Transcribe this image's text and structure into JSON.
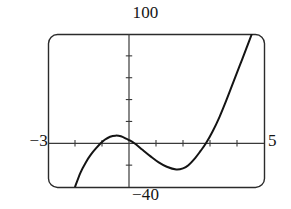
{
  "figure": {
    "kind": "graphing-calculator-viewport",
    "title": "",
    "frame": {
      "stroke_color": "#2b2b2b",
      "fill_color": "#ffffff",
      "corner_radius_px": 9,
      "left_px": 48,
      "top_px": 34,
      "right_px": 264,
      "bottom_px": 187
    },
    "labels": {
      "y_max": "100",
      "y_min": "−40",
      "x_min": "−3",
      "x_max": "5"
    }
  },
  "chart_data": {
    "type": "line",
    "title": "",
    "xlabel": "",
    "ylabel": "",
    "xlim": [
      -3,
      5
    ],
    "ylim": [
      -40,
      100
    ],
    "grid": false,
    "legend": null,
    "axis_style": "calculator-window-with-tick-marks",
    "x_ticks": [
      -3,
      -2,
      -1,
      0,
      1,
      2,
      3,
      4,
      5
    ],
    "y_ticks": [
      -40,
      -20,
      0,
      20,
      40,
      60,
      80,
      100
    ],
    "x_tick_interval": 1,
    "y_tick_interval": 20,
    "tick_labels_shown": false,
    "window_corner_labels": {
      "top": "100",
      "bottom": "−40",
      "left": "−3",
      "right": "5"
    },
    "curve": {
      "name": "cubic polynomial",
      "color": "#141414",
      "line_width_px": 2,
      "shape_description": "rises from below lower-left, crosses x-axis near x=-1.05, local maximum near x=-0.5 (y≈7), decreases through origin region, local minimum near x=1.75 (y≈-24), then rises steeply crossing x-axis near x=2.85 and exiting the top of the window near x=4.55",
      "x_intercepts": [
        -1.05,
        2.85
      ],
      "local_maximum": {
        "x": -0.5,
        "y": 7
      },
      "local_minimum": {
        "x": 1.75,
        "y": -24
      },
      "enters_window_at": {
        "x": -2.0,
        "y": -40
      },
      "exits_window_at": {
        "x": 4.55,
        "y": 100
      },
      "points": [
        {
          "x": -2.0,
          "y": -40.0
        },
        {
          "x": -1.8,
          "y": -27.0
        },
        {
          "x": -1.6,
          "y": -17.5
        },
        {
          "x": -1.4,
          "y": -10.0
        },
        {
          "x": -1.2,
          "y": -4.0
        },
        {
          "x": -1.05,
          "y": 0.0
        },
        {
          "x": -0.9,
          "y": 3.2
        },
        {
          "x": -0.7,
          "y": 6.0
        },
        {
          "x": -0.5,
          "y": 7.0
        },
        {
          "x": -0.3,
          "y": 6.4
        },
        {
          "x": -0.1,
          "y": 4.2
        },
        {
          "x": 0.0,
          "y": 3.0
        },
        {
          "x": 0.2,
          "y": 0.0
        },
        {
          "x": 0.5,
          "y": -6.0
        },
        {
          "x": 0.8,
          "y": -12.0
        },
        {
          "x": 1.1,
          "y": -17.5
        },
        {
          "x": 1.4,
          "y": -21.5
        },
        {
          "x": 1.75,
          "y": -24.0
        },
        {
          "x": 2.0,
          "y": -23.0
        },
        {
          "x": 2.2,
          "y": -20.0
        },
        {
          "x": 2.45,
          "y": -13.5
        },
        {
          "x": 2.65,
          "y": -7.0
        },
        {
          "x": 2.85,
          "y": 0.0
        },
        {
          "x": 3.1,
          "y": 11.0
        },
        {
          "x": 3.35,
          "y": 24.0
        },
        {
          "x": 3.6,
          "y": 39.0
        },
        {
          "x": 3.85,
          "y": 55.0
        },
        {
          "x": 4.1,
          "y": 71.0
        },
        {
          "x": 4.35,
          "y": 87.0
        },
        {
          "x": 4.55,
          "y": 100.0
        }
      ]
    }
  }
}
